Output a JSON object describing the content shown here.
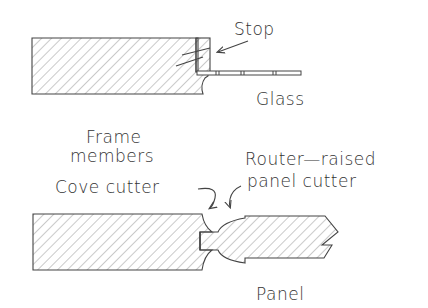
{
  "diagram": {
    "type": "woodworking cross-section",
    "top_section": {
      "labels": {
        "stop": "Stop",
        "glass": "Glass"
      }
    },
    "middle_labels": {
      "frame": "Frame",
      "members": "members",
      "cove_cutter": "Cove cutter",
      "router_raised": "Router—raised",
      "panel_cutter": "panel cutter"
    },
    "bottom_section": {
      "labels": {
        "panel": "Panel"
      }
    },
    "colors": {
      "line": "#444444",
      "text": "#333333",
      "background": "#ffffff"
    }
  }
}
